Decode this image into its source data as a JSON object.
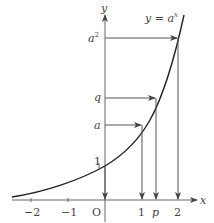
{
  "diagram": {
    "curve_label": "y = a",
    "curve_label_exp": "x",
    "axis_labels": {
      "x": "x",
      "y": "y",
      "origin": "O"
    },
    "x_ticks": [
      {
        "label": "−2",
        "value": -2
      },
      {
        "label": "−1",
        "value": -1
      },
      {
        "label": "1",
        "value": 1
      },
      {
        "label": "p",
        "value": 1.37
      },
      {
        "label": "2",
        "value": 2
      }
    ],
    "y_labels": [
      {
        "label": "1",
        "value": 1
      },
      {
        "label": "a",
        "value": "a"
      },
      {
        "label": "q",
        "value": "q"
      },
      {
        "label": "a",
        "sup": "2",
        "value": "a^2"
      }
    ],
    "arrows": [
      {
        "from": "y-axis at 1",
        "to": "x-axis at 0"
      },
      {
        "from": "y-axis at a",
        "to": "curve at x=1",
        "then": "x-axis at 1"
      },
      {
        "from": "y-axis at q",
        "to": "curve at x=p",
        "then": "x-axis at p"
      },
      {
        "from": "y-axis at a^2",
        "to": "curve at x=2",
        "then": "x-axis at 2"
      }
    ],
    "colors": {
      "axis": "#555555",
      "curve": "#222222",
      "arrow": "#555555",
      "text": "#444444"
    }
  }
}
